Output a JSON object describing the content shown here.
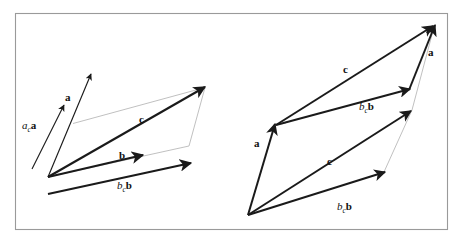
{
  "figure": {
    "background_color": "#ffffff",
    "frame": {
      "name": "figure-border",
      "stroke": "#9a9a9a",
      "x": 15,
      "y": 13,
      "width": 433,
      "height": 217
    },
    "colors": {
      "vector_stroke": "#1a1a1a",
      "guide_stroke": "#b0b0b0",
      "label_fill": "#111111",
      "frame_stroke": "#9a9a9a"
    },
    "panels": [
      {
        "id": "left-panel",
        "name": "left-parallelogram-diagram",
        "labels": [
          {
            "name": "label-ac-a",
            "id": "left-ac-a",
            "parts": [
              {
                "text": "a",
                "style": "italic"
              },
              {
                "text": "c",
                "style": "subscript"
              },
              {
                "text": "a",
                "style": "bold"
              }
            ],
            "plain": "a_c a",
            "x": 22,
            "y": 129
          },
          {
            "name": "label-a",
            "id": "left-a",
            "parts": [
              {
                "text": "a",
                "style": "bold"
              }
            ],
            "plain": "a",
            "x": 65,
            "y": 101
          },
          {
            "name": "label-c",
            "id": "left-c",
            "parts": [
              {
                "text": "c",
                "style": "bold"
              }
            ],
            "plain": "c",
            "x": 139,
            "y": 123
          },
          {
            "name": "label-b",
            "id": "left-b",
            "parts": [
              {
                "text": "b",
                "style": "bold"
              }
            ],
            "plain": "b",
            "x": 119,
            "y": 159
          },
          {
            "name": "label-bc-b",
            "id": "left-bc-b",
            "parts": [
              {
                "text": "b",
                "style": "italic"
              },
              {
                "text": "c",
                "style": "subscript"
              },
              {
                "text": "b",
                "style": "bold"
              }
            ],
            "plain": "b_c b",
            "x": 117,
            "y": 189
          }
        ]
      },
      {
        "id": "right-panel",
        "name": "right-parallelogram-diagram",
        "labels": [
          {
            "name": "label-c-upper",
            "id": "right-c-upper",
            "parts": [
              {
                "text": "c",
                "style": "bold"
              }
            ],
            "plain": "c",
            "x": 343,
            "y": 73
          },
          {
            "name": "label-bc-b-upper",
            "id": "right-bc-b-upper",
            "parts": [
              {
                "text": "b",
                "style": "italic"
              },
              {
                "text": "c",
                "style": "subscript"
              },
              {
                "text": "b",
                "style": "bold"
              }
            ],
            "plain": "b_c b",
            "x": 359,
            "y": 110
          },
          {
            "name": "label-a-upper",
            "id": "right-a-upper",
            "parts": [
              {
                "text": "a",
                "style": "bold"
              }
            ],
            "plain": "a",
            "x": 428,
            "y": 56
          },
          {
            "name": "label-a-lower",
            "id": "right-a-lower",
            "parts": [
              {
                "text": "a",
                "style": "bold"
              }
            ],
            "plain": "a",
            "x": 254,
            "y": 147
          },
          {
            "name": "label-c-lower",
            "id": "right-c-lower",
            "parts": [
              {
                "text": "c",
                "style": "bold"
              }
            ],
            "plain": "c",
            "x": 327,
            "y": 165
          },
          {
            "name": "label-bc-b-lower",
            "id": "right-bc-b-lower",
            "parts": [
              {
                "text": "b",
                "style": "italic"
              },
              {
                "text": "c",
                "style": "subscript"
              },
              {
                "text": "b",
                "style": "bold"
              }
            ],
            "plain": "b_c b",
            "x": 337,
            "y": 210
          }
        ]
      }
    ]
  }
}
